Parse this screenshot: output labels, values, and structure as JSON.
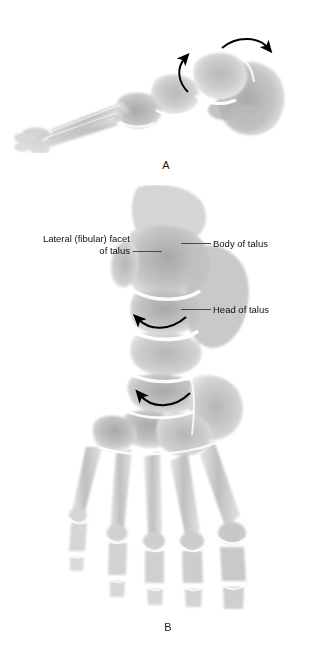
{
  "figure": {
    "panels": [
      {
        "letter": "A",
        "view": "lateral foot radiograph",
        "arrows": [
          {
            "name": "rotation-arrow-upper",
            "direction": "clockwise-right"
          },
          {
            "name": "rotation-arrow-lower",
            "direction": "counterclockwise-up"
          }
        ]
      },
      {
        "letter": "B",
        "view": "dorsoplantar foot radiograph",
        "arrows": [
          {
            "name": "rotation-arrow-body",
            "direction": "leftward-curved"
          },
          {
            "name": "rotation-arrow-head",
            "direction": "leftward-curved"
          }
        ]
      }
    ],
    "annotations": [
      {
        "id": "lateral-fibular-facet",
        "text": "Lateral (fibular) facet\nof talus"
      },
      {
        "id": "body-of-talus",
        "text": "Body of talus"
      },
      {
        "id": "head-of-talus",
        "text": "Head of talus"
      }
    ],
    "caption": {
      "text": "",
      "truncated": true
    }
  },
  "colors": {
    "background": "#ffffff",
    "text": "#111111",
    "leader_line": "#4a4a4a",
    "arrow": "#000000",
    "bone_light": "#dcdcdc",
    "bone_mid": "#b4b4b4",
    "bone_dark": "#8e8e8e",
    "joint_space": "#fdfdfd"
  }
}
